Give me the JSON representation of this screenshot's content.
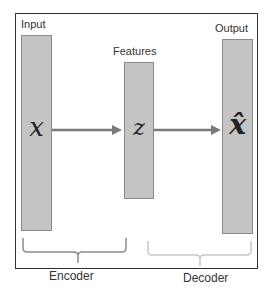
{
  "diagram": {
    "blocks": [
      {
        "id": "input",
        "label": "Input",
        "symbol": "x"
      },
      {
        "id": "features",
        "label": "Features",
        "symbol": "z"
      },
      {
        "id": "output",
        "label": "Output",
        "symbol": "x̂"
      }
    ],
    "groups": [
      {
        "id": "encoder",
        "label": "Encoder"
      },
      {
        "id": "decoder",
        "label": "Decoder"
      }
    ],
    "colors": {
      "bar_fill": "#c4c4c4",
      "bar_border": "#8a8a8a",
      "arrow": "#7a7a7a",
      "encoder_brace": "#8c8c8c",
      "decoder_brace": "#c8c8c8",
      "frame": "#333333"
    }
  }
}
